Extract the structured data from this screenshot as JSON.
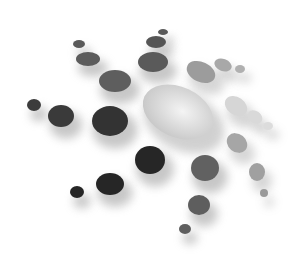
{
  "graphic": {
    "description": "Abstract radial burst of gray circles with soft drop shadows around a large central light ellipse",
    "background": "#ffffff",
    "center_ellipse": {
      "cx": 178,
      "cy": 112,
      "rx": 37,
      "ry": 25,
      "rotate": 25,
      "fill": "#d4d4d4",
      "highlight": "#f2f2f2"
    },
    "circles": [
      {
        "cx": 34,
        "cy": 105,
        "rx": 7,
        "ry": 6,
        "fill": "#3c3c3c"
      },
      {
        "cx": 61,
        "cy": 116,
        "rx": 13,
        "ry": 11,
        "fill": "#3a3a3a"
      },
      {
        "cx": 110,
        "cy": 121,
        "rx": 18,
        "ry": 15,
        "fill": "#333333"
      },
      {
        "cx": 79,
        "cy": 44,
        "rx": 6,
        "ry": 4,
        "fill": "#5a5a5a"
      },
      {
        "cx": 88,
        "cy": 59,
        "rx": 12,
        "ry": 7,
        "fill": "#5c5c5c"
      },
      {
        "cx": 115,
        "cy": 81,
        "rx": 16,
        "ry": 11,
        "fill": "#5e5e5e"
      },
      {
        "cx": 163,
        "cy": 32,
        "rx": 5,
        "ry": 3,
        "fill": "#5a5a5a"
      },
      {
        "cx": 156,
        "cy": 42,
        "rx": 10,
        "ry": 6,
        "fill": "#555555"
      },
      {
        "cx": 153,
        "cy": 62,
        "rx": 15,
        "ry": 10,
        "fill": "#5a5a5a"
      },
      {
        "cx": 201,
        "cy": 72,
        "rx": 15,
        "ry": 10,
        "rotate": 25,
        "fill": "#9c9c9c"
      },
      {
        "cx": 223,
        "cy": 65,
        "rx": 9,
        "ry": 6,
        "rotate": 20,
        "fill": "#a8a8a8"
      },
      {
        "cx": 240,
        "cy": 69,
        "rx": 5,
        "ry": 4,
        "fill": "#b0b0b0"
      },
      {
        "cx": 236,
        "cy": 106,
        "rx": 12,
        "ry": 9,
        "rotate": 35,
        "fill": "#d6d6d6"
      },
      {
        "cx": 255,
        "cy": 117,
        "rx": 8,
        "ry": 6,
        "rotate": 35,
        "fill": "#d9d9d9"
      },
      {
        "cx": 268,
        "cy": 126,
        "rx": 5,
        "ry": 4,
        "fill": "#dcdcdc"
      },
      {
        "cx": 237,
        "cy": 143,
        "rx": 11,
        "ry": 9,
        "rotate": 40,
        "fill": "#a6a6a6"
      },
      {
        "cx": 257,
        "cy": 172,
        "rx": 8,
        "ry": 9,
        "fill": "#a0a0a0"
      },
      {
        "cx": 264,
        "cy": 193,
        "rx": 4,
        "ry": 4,
        "fill": "#9a9a9a"
      },
      {
        "cx": 150,
        "cy": 160,
        "rx": 15,
        "ry": 14,
        "fill": "#262626"
      },
      {
        "cx": 110,
        "cy": 184,
        "rx": 14,
        "ry": 11,
        "fill": "#262626"
      },
      {
        "cx": 77,
        "cy": 192,
        "rx": 7,
        "ry": 6,
        "fill": "#262626"
      },
      {
        "cx": 205,
        "cy": 168,
        "rx": 14,
        "ry": 13,
        "fill": "#616161"
      },
      {
        "cx": 199,
        "cy": 205,
        "rx": 11,
        "ry": 10,
        "fill": "#5e5e5e"
      },
      {
        "cx": 185,
        "cy": 229,
        "rx": 6,
        "ry": 5,
        "fill": "#5e5e5e"
      }
    ]
  }
}
